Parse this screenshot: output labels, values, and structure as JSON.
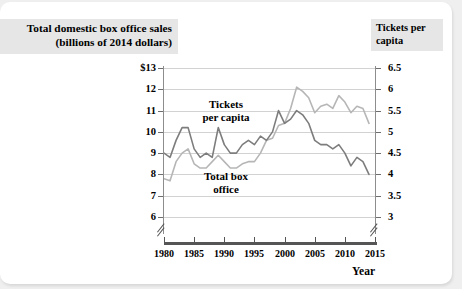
{
  "left_title": "Total domestic box office sales (billions of 2014 dollars)",
  "left_title_line1": "Total domestic box office sales",
  "left_title_line2": "(billions of 2014 dollars)",
  "right_title_line1": "Tickets per",
  "right_title_line2": "capita",
  "annotations": {
    "tickets_line1": "Tickets",
    "tickets_line2": "per capita",
    "boxoffice_line1": "Total box",
    "boxoffice_line2": "office"
  },
  "axis": {
    "x_label": "Year",
    "left_ticks": [
      "$13",
      "12",
      "11",
      "10",
      "9",
      "8",
      "7",
      "6"
    ],
    "right_ticks": [
      "6.5",
      "6",
      "5.5",
      "5",
      "4.5",
      "4",
      "3.5",
      "3"
    ],
    "x_ticks": [
      "1980",
      "1985",
      "1990",
      "1995",
      "2000",
      "2005",
      "2010",
      "2015"
    ]
  },
  "colors": {
    "series_tickets": "#7d7d7d",
    "series_boxoffice": "#b6b6b6",
    "gridline": "#d2d2d2",
    "axis": "#6e6e6e",
    "title_background": "#e6e6e6",
    "card_background": "#ffffff",
    "page_background": "#efefef"
  },
  "chart_data": {
    "type": "line",
    "xlabel": "Year",
    "ylabel": "Total domestic box office sales (billions of 2014 dollars)",
    "ylabel_right": "Tickets per capita",
    "grid": true,
    "legend": "inline-annotations",
    "xlim": [
      1980,
      2015
    ],
    "ylim": [
      6,
      13
    ],
    "ylim_right": [
      3,
      6.5
    ],
    "axis_break": true,
    "x": [
      1980,
      1981,
      1982,
      1983,
      1984,
      1985,
      1986,
      1987,
      1988,
      1989,
      1990,
      1991,
      1992,
      1993,
      1994,
      1995,
      1996,
      1997,
      1998,
      1999,
      2000,
      2001,
      2002,
      2003,
      2004,
      2005,
      2006,
      2007,
      2008,
      2009,
      2010,
      2011,
      2012,
      2013,
      2014
    ],
    "series": [
      {
        "name": "Total box office",
        "axis": "left",
        "color": "#b6b6b6",
        "units": "billions of 2014 dollars",
        "values": [
          7.8,
          7.7,
          8.6,
          9.0,
          9.2,
          8.5,
          8.3,
          8.3,
          8.6,
          8.9,
          8.6,
          8.3,
          8.3,
          8.5,
          8.6,
          8.6,
          9.0,
          9.6,
          9.7,
          10.3,
          10.4,
          11.1,
          12.1,
          11.9,
          11.6,
          10.9,
          11.2,
          11.3,
          11.1,
          11.7,
          11.4,
          10.9,
          11.2,
          11.1,
          10.4
        ]
      },
      {
        "name": "Tickets per capita",
        "axis": "right",
        "color": "#7d7d7d",
        "units": "tickets per capita",
        "values": [
          4.5,
          4.4,
          4.8,
          5.1,
          5.1,
          4.6,
          4.4,
          4.5,
          4.4,
          5.1,
          4.7,
          4.5,
          4.5,
          4.7,
          4.8,
          4.7,
          4.9,
          4.8,
          5.0,
          5.5,
          5.2,
          5.3,
          5.5,
          5.4,
          5.2,
          4.8,
          4.7,
          4.7,
          4.6,
          4.7,
          4.5,
          4.2,
          4.4,
          4.3,
          4.0
        ]
      }
    ]
  }
}
